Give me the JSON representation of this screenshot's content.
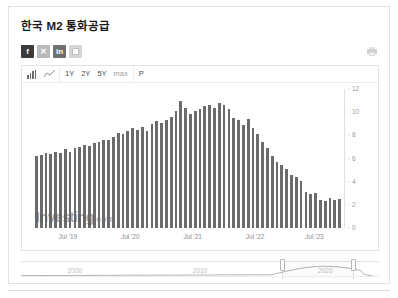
{
  "header": {
    "title": "한국 M2 통화공급",
    "print_icon": "print-icon"
  },
  "share": {
    "items": [
      {
        "name": "facebook",
        "label": "f"
      },
      {
        "name": "x-twitter",
        "label": "✕"
      },
      {
        "name": "linkedin",
        "label": "in"
      },
      {
        "name": "more",
        "label": ""
      }
    ]
  },
  "toolbar": {
    "chart_type_icons": [
      {
        "name": "bar-chart-icon",
        "label": ""
      },
      {
        "name": "line-chart-icon",
        "label": ""
      }
    ],
    "ranges": [
      {
        "label": "1Y",
        "active": false
      },
      {
        "label": "2Y",
        "active": false
      },
      {
        "label": "5Y",
        "active": false
      },
      {
        "label": "max",
        "active": true
      }
    ],
    "period_button": "P"
  },
  "watermark": {
    "brand": "Investing",
    "domain": ".com"
  },
  "navigator": {
    "labels": [
      "2000",
      "2010",
      "2020"
    ],
    "label_positions": [
      15,
      50,
      85
    ],
    "window_left_pct": 73,
    "window_right_pct": 93
  },
  "chart_data": {
    "type": "bar",
    "title": "한국 M2 통화공급",
    "xlabel": "",
    "ylabel": "",
    "ylim": [
      0,
      12
    ],
    "yticks": [
      0,
      2,
      4,
      6,
      8,
      10,
      12
    ],
    "grid": false,
    "legend": "none",
    "series_color": "#6b6b6b",
    "xticks": [
      "Jul '19",
      "Jul '20",
      "Jul '21",
      "Jul '22",
      "Jul '23"
    ],
    "xtick_positions_pct": [
      11.5,
      31.5,
      51.5,
      71.5,
      90.5
    ],
    "categories": [
      "2018-11",
      "2018-12",
      "2019-01",
      "2019-02",
      "2019-03",
      "2019-04",
      "2019-05",
      "2019-06",
      "2019-07",
      "2019-08",
      "2019-09",
      "2019-10",
      "2019-11",
      "2019-12",
      "2020-01",
      "2020-02",
      "2020-03",
      "2020-04",
      "2020-05",
      "2020-06",
      "2020-07",
      "2020-08",
      "2020-09",
      "2020-10",
      "2020-11",
      "2020-12",
      "2021-01",
      "2021-02",
      "2021-03",
      "2021-04",
      "2021-05",
      "2021-06",
      "2021-07",
      "2021-08",
      "2021-09",
      "2021-10",
      "2021-11",
      "2021-12",
      "2022-01",
      "2022-02",
      "2022-03",
      "2022-04",
      "2022-05",
      "2022-06",
      "2022-07",
      "2022-08",
      "2022-09",
      "2022-10",
      "2022-11",
      "2022-12",
      "2023-01",
      "2023-02",
      "2023-03",
      "2023-04",
      "2023-05",
      "2023-06",
      "2023-07",
      "2023-08",
      "2023-09",
      "2023-10",
      "2023-11",
      "2023-12",
      "2024-01",
      "2024-02"
    ],
    "values": [
      6.2,
      6.3,
      6.5,
      6.4,
      6.6,
      6.5,
      6.8,
      6.6,
      6.9,
      7.0,
      7.2,
      7.1,
      7.3,
      7.4,
      7.6,
      7.6,
      7.9,
      8.2,
      8.1,
      8.4,
      8.6,
      8.5,
      8.7,
      8.4,
      9.0,
      9.2,
      9.1,
      9.3,
      9.6,
      10.1,
      11.0,
      10.4,
      9.8,
      10.1,
      10.3,
      10.5,
      10.6,
      10.4,
      10.8,
      10.6,
      10.3,
      9.5,
      9.3,
      8.9,
      9.4,
      8.6,
      8.1,
      7.4,
      6.9,
      6.2,
      5.7,
      5.4,
      5.1,
      4.6,
      4.4,
      4.1,
      3.1,
      2.9,
      3.0,
      2.4,
      2.3,
      2.6,
      2.4,
      2.5
    ]
  }
}
